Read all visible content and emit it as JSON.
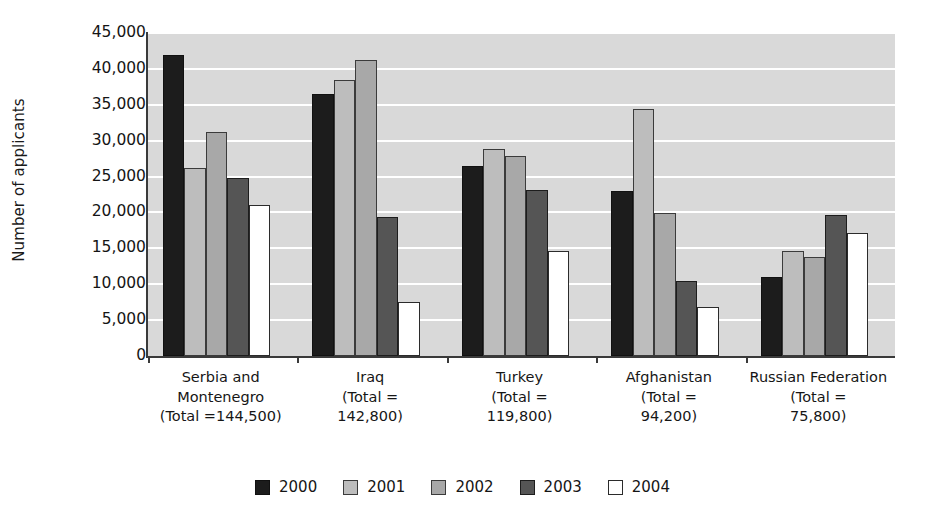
{
  "chart_data": {
    "type": "bar",
    "title": "",
    "xlabel": "",
    "ylabel": "Number of applicants",
    "ylim": [
      0,
      45000
    ],
    "ytick_values": [
      0,
      5000,
      10000,
      15000,
      20000,
      25000,
      30000,
      35000,
      40000,
      45000
    ],
    "ytick_labels": [
      "0",
      "5,000",
      "10,000",
      "15,000",
      "20,000",
      "25,000",
      "30,000",
      "35,000",
      "40,000",
      "45,000"
    ],
    "grid": true,
    "grid_axis": "y",
    "legend_position": "bottom",
    "categories": [
      "Serbia and Montenegro (Total =144,500)",
      "Iraq (Total = 142,800)",
      "Turkey (Total = 119,800)",
      "Afghanistan (Total = 94,200)",
      "Russian Federation (Total = 75,800)"
    ],
    "category_lines": [
      [
        "Serbia and",
        "Montenegro",
        "(Total =144,500)"
      ],
      [
        "Iraq",
        "(Total =",
        "142,800)"
      ],
      [
        "Turkey",
        "(Total =",
        "119,800)"
      ],
      [
        "Afghanistan",
        "(Total =",
        "94,200)"
      ],
      [
        "Russian Federation",
        "(Total =",
        "75,800)"
      ]
    ],
    "category_totals": [
      144500,
      142800,
      119800,
      94200,
      75800
    ],
    "series": [
      {
        "name": "2000",
        "color": "#1c1c1c",
        "values": [
          42000,
          36500,
          26500,
          23000,
          11000
        ]
      },
      {
        "name": "2001",
        "color": "#bdbdbd",
        "values": [
          26200,
          38500,
          28800,
          34400,
          14700
        ]
      },
      {
        "name": "2002",
        "color": "#a8a8a8",
        "values": [
          31200,
          41200,
          27900,
          19900,
          13800
        ]
      },
      {
        "name": "2003",
        "color": "#555555",
        "values": [
          24800,
          19300,
          23100,
          10400,
          19700
        ]
      },
      {
        "name": "2004",
        "color": "#ffffff",
        "values": [
          21000,
          7500,
          14600,
          6800,
          17100
        ]
      }
    ]
  },
  "legend": {
    "entries": [
      {
        "label": "2000",
        "swatch": "c2000"
      },
      {
        "label": "2001",
        "swatch": "c2001"
      },
      {
        "label": "2002",
        "swatch": "c2002"
      },
      {
        "label": "2003",
        "swatch": "c2003"
      },
      {
        "label": "2004",
        "swatch": "c2004"
      }
    ]
  },
  "axes": {
    "y_title": "Number of applicants",
    "plot_background": "#d9d9d9",
    "gridline_color": "#ffffff",
    "axis_color": "#3a3a3a"
  }
}
